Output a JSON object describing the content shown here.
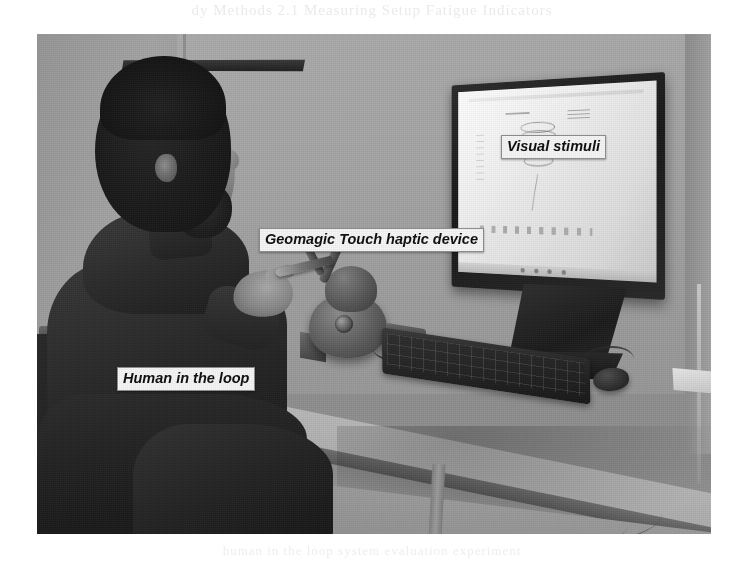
{
  "figure": {
    "kind": "photograph",
    "scene_description": "Experimental setup: a seated man operating a Geomagic Touch haptic device at a desk while viewing visual stimuli on a wall-mounted monitor",
    "frame": {
      "left": 37,
      "top": 34,
      "width": 674,
      "height": 500
    },
    "palette": {
      "wall": "#a2a2a0",
      "desk": "#b0b0ac",
      "monitor_bezel": "#1f1f1e",
      "screen": "#eeeeec",
      "clothing": "#282826",
      "label_background": "#f2f2f0",
      "label_text": "#101010"
    }
  },
  "annotations": [
    {
      "id": "visual-stimuli",
      "text": "Visual stimuli",
      "target": "monitor-screen"
    },
    {
      "id": "haptic-device",
      "text": "Geomagic Touch haptic device",
      "target": "haptic-device"
    },
    {
      "id": "human-loop",
      "text": "Human in the loop",
      "target": "person"
    }
  ],
  "scene": {
    "monitor": {
      "name": "wall-mounted display",
      "screen_content": "CAD / simulation view showing a faint 3D coil (helix) stimulus on a white background with a bottom taskbar"
    },
    "haptic_device": {
      "name": "Geomagic Touch haptic device",
      "parts": "articulated arm, stylus, weighted base"
    },
    "person": {
      "posture": "seated in profile facing right, holding the stylus in the right hand"
    },
    "peripherals": [
      "keyboard",
      "mouse",
      "cables"
    ]
  },
  "page_bleed": {
    "top_text": "dy Methods  2.1  Measuring Setup  Fatigue Indicators",
    "bottom_text": "human in the loop system evaluation experiment"
  }
}
